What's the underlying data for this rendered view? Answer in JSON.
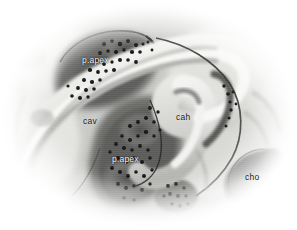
{
  "figure": {
    "kind": "histological-section",
    "background_color": "#ffffff",
    "width": 297,
    "height": 230,
    "tissue_base_color": "#b9b9b7",
    "tissue_dark_color": "#4a4a48",
    "tissue_light_color": "#efefed",
    "cell_dot_color": "#141414",
    "outline_color": "#2a2a28"
  },
  "labels": [
    {
      "id": "p-apex-upper",
      "text": "p.apex",
      "x": 82,
      "y": 56,
      "tone": "light"
    },
    {
      "id": "cav",
      "text": "cav",
      "x": 83,
      "y": 117,
      "tone": "dark"
    },
    {
      "id": "cah",
      "text": "cah",
      "x": 176,
      "y": 113,
      "tone": "dark"
    },
    {
      "id": "p-apex-lower",
      "text": "p.apex",
      "x": 112,
      "y": 155,
      "tone": "light"
    },
    {
      "id": "cho",
      "text": "cho",
      "x": 245,
      "y": 173,
      "tone": "dark"
    }
  ]
}
